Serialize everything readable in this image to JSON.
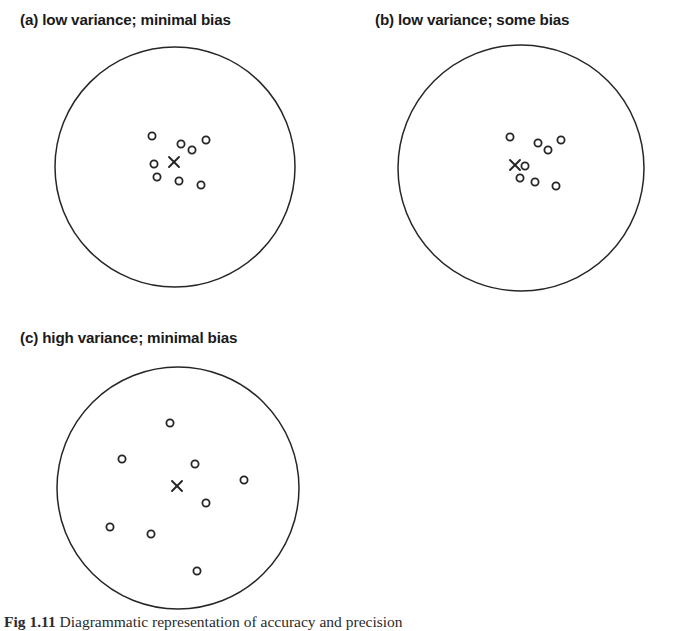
{
  "figure": {
    "background": "#ffffff",
    "ink": "#262626",
    "width": 690,
    "height": 631,
    "caption": {
      "lead": "Fig 1.11",
      "text": "Diagrammatic representation of accuracy and precision"
    }
  },
  "chart_data": {
    "type": "scatter",
    "xlabel": "",
    "ylabel": "",
    "grid": false,
    "legend": null,
    "marker": {
      "observation": "open-circle",
      "target": "x-cross"
    },
    "panels": [
      {
        "key": "a",
        "label": "(a) low variance; minimal bias",
        "variance": "low",
        "bias": "minimal",
        "title_x": 20,
        "title_y": 12,
        "circle": {
          "cx": 175,
          "cy": 167,
          "r": 120
        },
        "target": {
          "x": 174,
          "y": 162
        },
        "points": [
          {
            "x": 152,
            "y": 136
          },
          {
            "x": 181,
            "y": 144
          },
          {
            "x": 192,
            "y": 150
          },
          {
            "x": 206,
            "y": 140
          },
          {
            "x": 154,
            "y": 164
          },
          {
            "x": 157,
            "y": 177
          },
          {
            "x": 179,
            "y": 181
          },
          {
            "x": 201,
            "y": 185
          }
        ]
      },
      {
        "key": "b",
        "label": "(b) low variance;  some bias",
        "variance": "low",
        "bias": "some",
        "title_x": 375,
        "title_y": 12,
        "circle": {
          "cx": 521,
          "cy": 168,
          "r": 123
        },
        "target": {
          "x": 515,
          "y": 165
        },
        "points": [
          {
            "x": 510,
            "y": 137
          },
          {
            "x": 538,
            "y": 143
          },
          {
            "x": 548,
            "y": 150
          },
          {
            "x": 561,
            "y": 140
          },
          {
            "x": 525,
            "y": 166
          },
          {
            "x": 520,
            "y": 178
          },
          {
            "x": 535,
            "y": 182
          },
          {
            "x": 556,
            "y": 186
          }
        ]
      },
      {
        "key": "c",
        "label": "(c) high variance;  minimal bias",
        "variance": "high",
        "bias": "minimal",
        "title_x": 20,
        "title_y": 330,
        "circle": {
          "cx": 178,
          "cy": 488,
          "r": 121
        },
        "target": {
          "x": 177,
          "y": 486
        },
        "points": [
          {
            "x": 170,
            "y": 423
          },
          {
            "x": 122,
            "y": 459
          },
          {
            "x": 195,
            "y": 464
          },
          {
            "x": 244,
            "y": 480
          },
          {
            "x": 206,
            "y": 503
          },
          {
            "x": 110,
            "y": 527
          },
          {
            "x": 151,
            "y": 534
          },
          {
            "x": 197,
            "y": 571
          }
        ]
      }
    ]
  }
}
